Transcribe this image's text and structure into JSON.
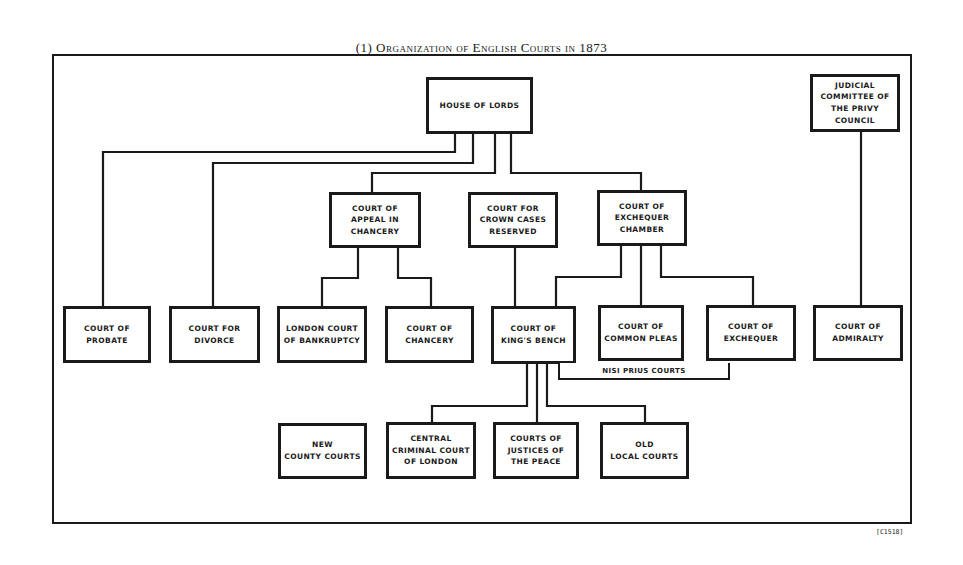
{
  "title": "(1) Organization of English Courts in 1873",
  "figure_code": "[C1518]",
  "nodes": {
    "house_of_lords": "HOUSE OF LORDS",
    "privy_council": "JUDICIAL\nCOMMITTEE OF\nTHE PRIVY\nCOUNCIL",
    "appeal_chancery": "COURT OF\nAPPEAL IN\nCHANCERY",
    "crown_cases": "COURT FOR\nCROWN CASES\nRESERVED",
    "exchequer_chamber": "COURT OF\nEXCHEQUER\nCHAMBER",
    "probate": "COURT OF\nPROBATE",
    "divorce": "COURT FOR\nDIVORCE",
    "bankruptcy": "LONDON COURT\nOF BANKRUPTCY",
    "chancery": "COURT OF\nCHANCERY",
    "kings_bench": "COURT OF\nKING'S BENCH",
    "common_pleas": "COURT OF\nCOMMON PLEAS",
    "exchequer": "COURT OF\nEXCHEQUER",
    "admiralty": "COURT OF\nADMIRALTY",
    "nisi_prius": "NISI PRIUS COURTS",
    "county_courts": "NEW\nCOUNTY COURTS",
    "central_criminal": "CENTRAL\nCRIMINAL COURT\nOF LONDON",
    "justices_peace": "COURTS OF\nJUSTICES OF\nTHE PEACE",
    "old_local": "OLD\nLOCAL COURTS"
  },
  "edges": [
    [
      "house_of_lords",
      "probate"
    ],
    [
      "house_of_lords",
      "divorce"
    ],
    [
      "house_of_lords",
      "appeal_chancery"
    ],
    [
      "house_of_lords",
      "exchequer_chamber"
    ],
    [
      "appeal_chancery",
      "bankruptcy"
    ],
    [
      "appeal_chancery",
      "chancery"
    ],
    [
      "crown_cases",
      "kings_bench"
    ],
    [
      "exchequer_chamber",
      "kings_bench"
    ],
    [
      "exchequer_chamber",
      "common_pleas"
    ],
    [
      "exchequer_chamber",
      "exchequer"
    ],
    [
      "privy_council",
      "admiralty"
    ],
    [
      "kings_bench",
      "central_criminal"
    ],
    [
      "kings_bench",
      "justices_peace"
    ],
    [
      "kings_bench",
      "old_local"
    ],
    [
      "kings_bench",
      "nisi_prius"
    ]
  ]
}
